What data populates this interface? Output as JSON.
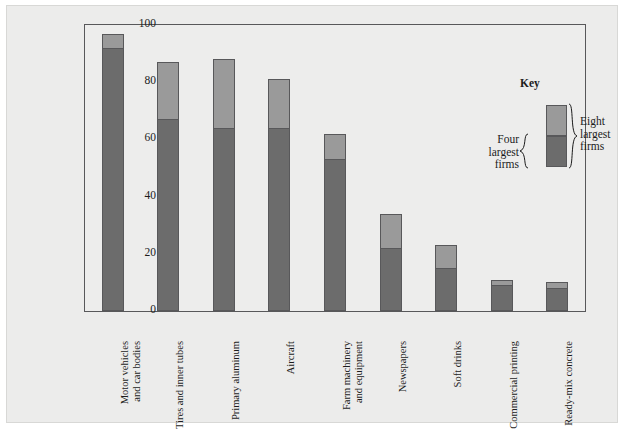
{
  "chart_data": {
    "type": "bar",
    "subtype": "stacked-bar",
    "title": "",
    "xlabel": "",
    "ylabel": "Percentage of Total Industry Output",
    "ylim": [
      0,
      100
    ],
    "yticks": [
      0,
      20,
      40,
      60,
      80,
      100
    ],
    "ytick_labels": [
      "0",
      "20",
      "40",
      "60",
      "80",
      "100"
    ],
    "grid": false,
    "legend_position": "inside-upper-right",
    "categories": [
      "Motor vehicles\nand car bodies",
      "Tires and inner tubes",
      "Primary aluminum",
      "Aircraft",
      "Farm machinery\nand equipment",
      "Newspapers",
      "Soft drinks",
      "Commercial printing",
      "Ready-mix concrete"
    ],
    "series": [
      {
        "name": "Four largest firms",
        "color": "#6c6c6c",
        "values": [
          92,
          67,
          64,
          64,
          53,
          22,
          15,
          9,
          8
        ]
      },
      {
        "name": "Eight largest firms",
        "color": "#9a9a9a",
        "values": [
          97,
          87,
          88,
          81,
          62,
          34,
          23,
          11,
          10
        ]
      }
    ]
  },
  "legend": {
    "title": "Key",
    "four_label": "Four\nlargest\nfirms",
    "eight_label": "Eight\nlargest\nfirms",
    "brace_left": "{",
    "brace_right": "}"
  },
  "colors": {
    "dark_segment": "#6c6c6c",
    "light_segment": "#9a9a9a",
    "axis": "#58585a",
    "plot_background": "#ededec",
    "page_background": "#ececeb",
    "text": "#1c1c1c"
  }
}
